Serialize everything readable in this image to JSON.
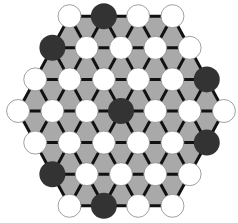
{
  "game": {
    "title": "Hexagonal triangular-lattice board",
    "colors": {
      "background": "#ffffff",
      "board_fill": "#a9a9a9",
      "line": "#111111",
      "white_piece": "#ffffff",
      "white_piece_outline": "#888888",
      "black_piece": "#333333"
    },
    "geometry": {
      "center_x": 121,
      "center_y": 111,
      "dx": 34.3,
      "dy": 31.6,
      "piece_radius_white": 11.5,
      "piece_radius_black": 13
    },
    "rows": [
      [
        "W",
        "B",
        "W",
        "W"
      ],
      [
        "B",
        "W",
        "W",
        "W",
        "W"
      ],
      [
        "W",
        "W",
        "W",
        "W",
        "W",
        "B"
      ],
      [
        "W",
        "W",
        "W",
        "B",
        "W",
        "W",
        "W"
      ],
      [
        "W",
        "W",
        "W",
        "W",
        "W",
        "B"
      ],
      [
        "B",
        "W",
        "W",
        "W",
        "W"
      ],
      [
        "W",
        "B",
        "W",
        "W"
      ]
    ],
    "piece_counts": {
      "white": 29,
      "black": 8
    }
  }
}
